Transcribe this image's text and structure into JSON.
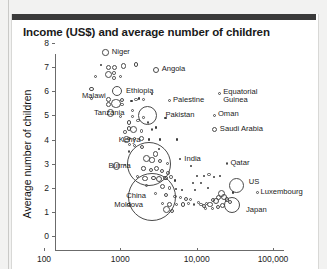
{
  "page": {
    "background_color": "#f2f2f1",
    "card_color": "#ffffff",
    "topbar_color": "#3a3a3a"
  },
  "chart_data": {
    "type": "scatter",
    "title": "Income (US$) and average number of children",
    "xlabel": "",
    "ylabel": "Average number of children",
    "xscale": "log",
    "xlim": [
      100,
      100000
    ],
    "ylim": [
      0,
      8
    ],
    "grid": false,
    "legend": null,
    "xticks": [
      "100",
      "1000",
      "10,000",
      "100,000"
    ],
    "xtick_values": [
      100,
      1000,
      10000,
      100000
    ],
    "yticks": [
      "0",
      "1",
      "2",
      "3",
      "4",
      "5",
      "6",
      "7",
      "8"
    ],
    "ytick_values": [
      0,
      1,
      2,
      3,
      4,
      5,
      6,
      7,
      8
    ],
    "bubble_encoding": "population",
    "labeled_points": [
      {
        "name": "Niger",
        "income": 640,
        "children": 7.6,
        "r": 3.2,
        "label_dx": 6,
        "label_dy": -4,
        "align": "left"
      },
      {
        "name": "Angola",
        "income": 2900,
        "children": 6.9,
        "r": 3.0,
        "label_dx": 6,
        "label_dy": -4,
        "align": "left"
      },
      {
        "name": "Ethiopia",
        "income": 900,
        "children": 6.0,
        "r": 5.2,
        "label_dx": 7,
        "label_dy": -3,
        "align": "left"
      },
      {
        "name": "Malawi",
        "income": 420,
        "children": 6.1,
        "r": 2.2,
        "label_dx": -6,
        "label_dy": 4,
        "align": "right"
      },
      {
        "name": "Tanzania",
        "income": 740,
        "children": 5.1,
        "r": 3.6,
        "label_dx": -6,
        "label_dy": -3,
        "align": "right"
      },
      {
        "name": "Pakistan",
        "income": 2300,
        "children": 5.0,
        "r": 9.5,
        "label_dx": 11,
        "label_dy": -3,
        "align": "left"
      },
      {
        "name": "Palestine",
        "income": 4400,
        "children": 5.6,
        "r": 1.5,
        "label_dx": 5,
        "label_dy": -4,
        "align": "left"
      },
      {
        "name": "Equatorial Guinea",
        "income": 20000,
        "children": 5.9,
        "r": 1.5,
        "label_dx": 5,
        "label_dy": -4,
        "align": "left"
      },
      {
        "name": "Oman",
        "income": 17000,
        "children": 5.0,
        "r": 1.7,
        "label_dx": 5,
        "label_dy": -4,
        "align": "left"
      },
      {
        "name": "Saudi Arabia",
        "income": 17000,
        "children": 4.4,
        "r": 2.6,
        "label_dx": 6,
        "label_dy": -4,
        "align": "left"
      },
      {
        "name": "Kenya",
        "income": 1200,
        "children": 4.0,
        "r": 3.4,
        "label_dx": -6,
        "label_dy": -3,
        "align": "right"
      },
      {
        "name": "India",
        "income": 2400,
        "children": 3.0,
        "r": 22.0,
        "label_dx": 16,
        "label_dy": -8,
        "align": "left"
      },
      {
        "name": "Burma",
        "income": 900,
        "children": 2.9,
        "r": 3.6,
        "label_dx": -6,
        "label_dy": -3,
        "align": "right"
      },
      {
        "name": "Qatar",
        "income": 25000,
        "children": 3.0,
        "r": 1.4,
        "label_dx": 5,
        "label_dy": -4,
        "align": "left"
      },
      {
        "name": "China",
        "income": 2600,
        "children": 1.6,
        "r": 24.0,
        "label_dx": -26,
        "label_dy": -4,
        "align": "right"
      },
      {
        "name": "US",
        "income": 33000,
        "children": 2.1,
        "r": 7.5,
        "label_dx": 8,
        "label_dy": -6,
        "align": "left"
      },
      {
        "name": "Luxembourg",
        "income": 62000,
        "children": 1.8,
        "r": 1.4,
        "label_dx": 5,
        "label_dy": -4,
        "align": "left"
      },
      {
        "name": "Japan",
        "income": 29000,
        "children": 1.3,
        "r": 8.0,
        "label_dx": 9,
        "label_dy": 2,
        "align": "left"
      },
      {
        "name": "Moldova",
        "income": 1300,
        "children": 1.3,
        "r": 1.6,
        "label_dx": -6,
        "label_dy": -3,
        "align": "right"
      }
    ],
    "unlabeled_points": [
      {
        "income": 560,
        "children": 7.1,
        "r": 1.2
      },
      {
        "income": 700,
        "children": 7.0,
        "r": 2.6
      },
      {
        "income": 830,
        "children": 7.0,
        "r": 2.6
      },
      {
        "income": 1100,
        "children": 7.05,
        "r": 2.8
      },
      {
        "income": 1600,
        "children": 7.1,
        "r": 2.4
      },
      {
        "income": 700,
        "children": 6.7,
        "r": 3.6
      },
      {
        "income": 830,
        "children": 6.75,
        "r": 1.8
      },
      {
        "income": 830,
        "children": 6.55,
        "r": 1.8
      },
      {
        "income": 1000,
        "children": 6.6,
        "r": 1.5
      },
      {
        "income": 470,
        "children": 6.6,
        "r": 1.5
      },
      {
        "income": 420,
        "children": 5.7,
        "r": 1.3
      },
      {
        "income": 700,
        "children": 5.65,
        "r": 2.4
      },
      {
        "income": 700,
        "children": 5.45,
        "r": 2.4
      },
      {
        "income": 880,
        "children": 5.5,
        "r": 4.6
      },
      {
        "income": 1050,
        "children": 5.65,
        "r": 2.0
      },
      {
        "income": 1050,
        "children": 5.45,
        "r": 1.8
      },
      {
        "income": 1400,
        "children": 5.6,
        "r": 1.2
      },
      {
        "income": 1600,
        "children": 5.65,
        "r": 1.6
      },
      {
        "income": 1750,
        "children": 5.7,
        "r": 1.2
      },
      {
        "income": 2000,
        "children": 5.65,
        "r": 1.4
      },
      {
        "income": 1450,
        "children": 5.2,
        "r": 1.6
      },
      {
        "income": 1000,
        "children": 4.95,
        "r": 1.6
      },
      {
        "income": 1450,
        "children": 4.95,
        "r": 1.4
      },
      {
        "income": 1700,
        "children": 4.8,
        "r": 1.6
      },
      {
        "income": 2000,
        "children": 4.9,
        "r": 1.3
      },
      {
        "income": 2300,
        "children": 4.7,
        "r": 1.3
      },
      {
        "income": 1300,
        "children": 4.7,
        "r": 2.4
      },
      {
        "income": 1300,
        "children": 4.45,
        "r": 2.2
      },
      {
        "income": 1500,
        "children": 4.4,
        "r": 3.4
      },
      {
        "income": 1150,
        "children": 4.3,
        "r": 1.8
      },
      {
        "income": 1900,
        "children": 4.35,
        "r": 1.6
      },
      {
        "income": 2600,
        "children": 4.4,
        "r": 1.4
      },
      {
        "income": 2900,
        "children": 4.5,
        "r": 1.1
      },
      {
        "income": 1300,
        "children": 4.05,
        "r": 1.6
      },
      {
        "income": 1550,
        "children": 4.05,
        "r": 1.6
      },
      {
        "income": 1900,
        "children": 4.05,
        "r": 2.4
      },
      {
        "income": 2400,
        "children": 4.0,
        "r": 1.1
      },
      {
        "income": 3300,
        "children": 4.0,
        "r": 1.1
      },
      {
        "income": 1300,
        "children": 3.8,
        "r": 1.5
      },
      {
        "income": 1550,
        "children": 3.75,
        "r": 1.5
      },
      {
        "income": 1900,
        "children": 3.7,
        "r": 2.0
      },
      {
        "income": 3200,
        "children": 3.6,
        "r": 1.1
      },
      {
        "income": 1300,
        "children": 3.5,
        "r": 1.4
      },
      {
        "income": 2900,
        "children": 3.4,
        "r": 2.8
      },
      {
        "income": 2200,
        "children": 3.2,
        "r": 3.4
      },
      {
        "income": 2600,
        "children": 3.15,
        "r": 2.6
      },
      {
        "income": 3300,
        "children": 3.1,
        "r": 2.0
      },
      {
        "income": 4200,
        "children": 3.0,
        "r": 1.5
      },
      {
        "income": 1150,
        "children": 2.95,
        "r": 1.3
      },
      {
        "income": 2000,
        "children": 2.8,
        "r": 2.2
      },
      {
        "income": 2500,
        "children": 2.75,
        "r": 2.0
      },
      {
        "income": 3000,
        "children": 2.8,
        "r": 2.6
      },
      {
        "income": 3500,
        "children": 2.7,
        "r": 2.2
      },
      {
        "income": 4200,
        "children": 2.6,
        "r": 1.8
      },
      {
        "income": 1700,
        "children": 2.45,
        "r": 1.5
      },
      {
        "income": 2100,
        "children": 2.4,
        "r": 2.6
      },
      {
        "income": 2700,
        "children": 2.4,
        "r": 2.4
      },
      {
        "income": 3200,
        "children": 2.35,
        "r": 3.0
      },
      {
        "income": 3900,
        "children": 2.4,
        "r": 2.2
      },
      {
        "income": 4600,
        "children": 2.45,
        "r": 1.8
      },
      {
        "income": 5200,
        "children": 2.3,
        "r": 1.2
      },
      {
        "income": 2200,
        "children": 2.1,
        "r": 1.8
      },
      {
        "income": 3600,
        "children": 2.05,
        "r": 2.6
      },
      {
        "income": 4400,
        "children": 2.0,
        "r": 1.8
      },
      {
        "income": 5400,
        "children": 1.95,
        "r": 1.2
      },
      {
        "income": 6500,
        "children": 1.9,
        "r": 1.1
      },
      {
        "income": 2900,
        "children": 1.75,
        "r": 1.4
      },
      {
        "income": 4000,
        "children": 1.7,
        "r": 2.0
      },
      {
        "income": 5200,
        "children": 1.65,
        "r": 1.6
      },
      {
        "income": 6200,
        "children": 1.6,
        "r": 1.6
      },
      {
        "income": 7200,
        "children": 1.55,
        "r": 2.0
      },
      {
        "income": 8200,
        "children": 1.5,
        "r": 1.5
      },
      {
        "income": 3600,
        "children": 1.35,
        "r": 1.6
      },
      {
        "income": 4400,
        "children": 1.3,
        "r": 2.4
      },
      {
        "income": 5400,
        "children": 1.3,
        "r": 1.6
      },
      {
        "income": 6600,
        "children": 1.3,
        "r": 2.2
      },
      {
        "income": 7800,
        "children": 1.35,
        "r": 1.4
      },
      {
        "income": 9200,
        "children": 1.3,
        "r": 1.4
      },
      {
        "income": 4000,
        "children": 1.1,
        "r": 3.4
      },
      {
        "income": 4700,
        "children": 1.05,
        "r": 2.0
      },
      {
        "income": 10500,
        "children": 1.4,
        "r": 1.4
      },
      {
        "income": 11500,
        "children": 1.3,
        "r": 1.8
      },
      {
        "income": 12500,
        "children": 1.25,
        "r": 2.2
      },
      {
        "income": 13500,
        "children": 1.35,
        "r": 1.6
      },
      {
        "income": 15000,
        "children": 1.3,
        "r": 2.8
      },
      {
        "income": 16500,
        "children": 1.5,
        "r": 2.2
      },
      {
        "income": 18000,
        "children": 1.45,
        "r": 3.0
      },
      {
        "income": 19500,
        "children": 1.6,
        "r": 2.6
      },
      {
        "income": 21000,
        "children": 1.75,
        "r": 3.6
      },
      {
        "income": 23000,
        "children": 1.6,
        "r": 3.0
      },
      {
        "income": 25000,
        "children": 1.5,
        "r": 2.4
      },
      {
        "income": 27000,
        "children": 1.4,
        "r": 2.0
      },
      {
        "income": 22000,
        "children": 1.25,
        "r": 2.6
      },
      {
        "income": 19000,
        "children": 1.2,
        "r": 2.0
      },
      {
        "income": 16000,
        "children": 1.15,
        "r": 1.6
      },
      {
        "income": 13000,
        "children": 1.15,
        "r": 1.4
      },
      {
        "income": 30000,
        "children": 1.8,
        "r": 1.2
      },
      {
        "income": 14000,
        "children": 2.0,
        "r": 1.1
      },
      {
        "income": 11500,
        "children": 2.2,
        "r": 1.1
      },
      {
        "income": 17000,
        "children": 2.45,
        "r": 1.2
      },
      {
        "income": 20000,
        "children": 2.5,
        "r": 1.1
      },
      {
        "income": 14500,
        "children": 2.55,
        "r": 1.6
      },
      {
        "income": 12500,
        "children": 2.5,
        "r": 1.1
      },
      {
        "income": 10000,
        "children": 2.5,
        "r": 1.1
      },
      {
        "income": 8500,
        "children": 2.9,
        "r": 1.1
      },
      {
        "income": 6000,
        "children": 3.2,
        "r": 1.1
      },
      {
        "income": 5500,
        "children": 4.0,
        "r": 1.1
      },
      {
        "income": 3900,
        "children": 4.9,
        "r": 1.1
      },
      {
        "income": 2600,
        "children": 5.9,
        "r": 1.1
      },
      {
        "income": 9500,
        "children": 1.9,
        "r": 1.1
      },
      {
        "income": 9000,
        "children": 2.2,
        "r": 1.2
      }
    ]
  }
}
